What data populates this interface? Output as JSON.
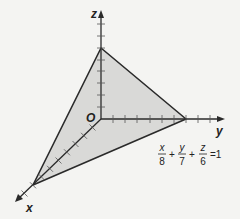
{
  "diagram": {
    "type": "3d-coordinate-plane",
    "axes": {
      "x": {
        "label": "x"
      },
      "y": {
        "label": "y"
      },
      "z": {
        "label": "z"
      }
    },
    "origin_label": "O",
    "plane": {
      "fill_color": "#d9d9d7",
      "edge_color": "#2a2a2a",
      "intercepts": {
        "x": 8,
        "y": 7,
        "z": 6
      }
    },
    "equation": {
      "terms": [
        {
          "num": "x",
          "den": "8"
        },
        {
          "num": "y",
          "den": "7"
        },
        {
          "num": "z",
          "den": "6"
        }
      ],
      "plus": "+",
      "rhs": "=1"
    }
  }
}
